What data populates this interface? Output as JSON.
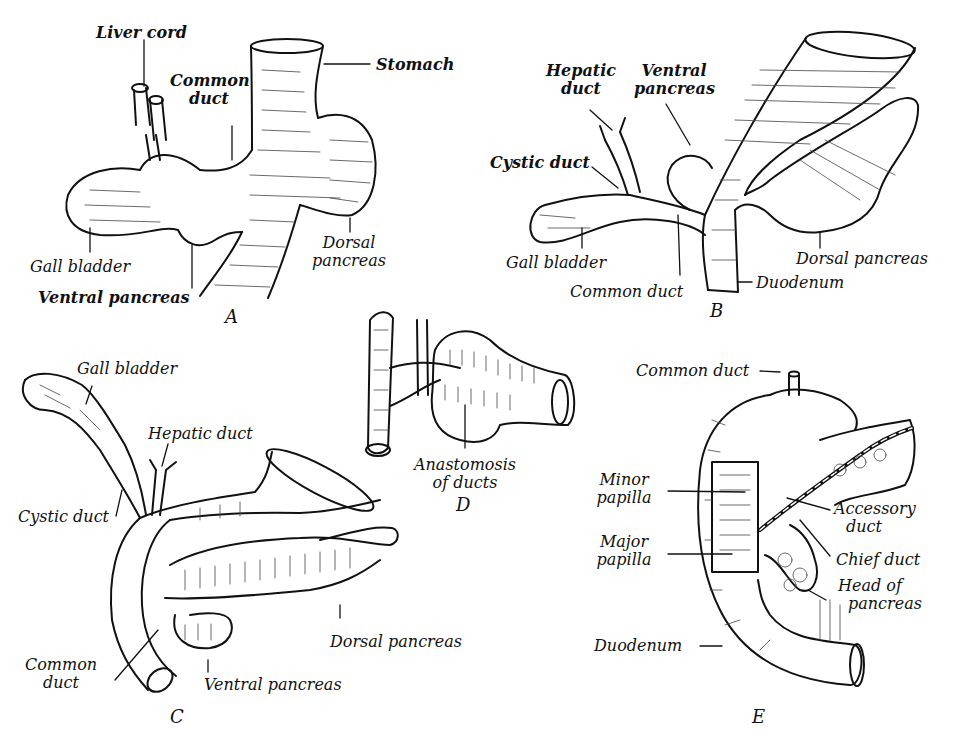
{
  "figure": {
    "panels": [
      {
        "id": "A",
        "letter": "A",
        "labels": {
          "liver_cord": "Liver cord",
          "common_duct_1": "Common",
          "common_duct_2": "duct",
          "stomach": "Stomach",
          "gall_bladder": "Gall bladder",
          "ventral_pancreas": "Ventral pancreas",
          "dorsal_pancreas_1": "Dorsal",
          "dorsal_pancreas_2": "pancreas"
        }
      },
      {
        "id": "B",
        "letter": "B",
        "labels": {
          "hepatic_duct_1": "Hepatic",
          "hepatic_duct_2": "duct",
          "ventral_pancreas_1": "Ventral",
          "ventral_pancreas_2": "pancreas",
          "cystic_duct": "Cystic duct",
          "gall_bladder": "Gall bladder",
          "common_duct": "Common duct",
          "duodenum": "Duodenum",
          "dorsal_pancreas": "Dorsal pancreas"
        }
      },
      {
        "id": "C",
        "letter": "C",
        "labels": {
          "gall_bladder": "Gall bladder",
          "hepatic_duct": "Hepatic duct",
          "cystic_duct": "Cystic duct",
          "common_duct_1": "Common",
          "common_duct_2": "duct",
          "ventral_pancreas": "Ventral pancreas",
          "dorsal_pancreas": "Dorsal pancreas"
        }
      },
      {
        "id": "D",
        "letter": "D",
        "labels": {
          "anastomosis_1": "Anastomosis",
          "anastomosis_2": "of ducts"
        }
      },
      {
        "id": "E",
        "letter": "E",
        "labels": {
          "common_duct": "Common duct",
          "minor_papilla_1": "Minor",
          "minor_papilla_2": "papilla",
          "major_papilla_1": "Major",
          "major_papilla_2": "papilla",
          "accessory_duct_1": "Accessory",
          "accessory_duct_2": "duct",
          "chief_duct": "Chief duct",
          "head_of_pancreas_1": "Head of",
          "head_of_pancreas_2": "pancreas",
          "duodenum": "Duodenum"
        }
      }
    ]
  }
}
